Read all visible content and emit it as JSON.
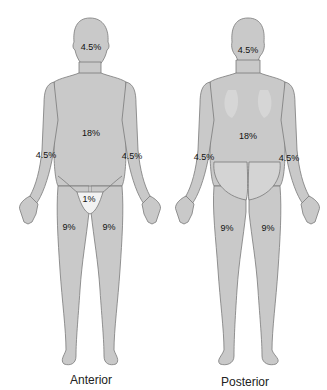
{
  "figure": {
    "colors": {
      "body_fill": "#c9c9c9",
      "body_outline": "#7a7a7a",
      "perineum_fill": "#f2f2f2",
      "label": "#111111"
    },
    "views": [
      {
        "id": "anterior",
        "caption": "Anterior",
        "labels": {
          "head": "4.5%",
          "trunk": "18%",
          "right_arm": "4.5%",
          "left_arm": "4.5%",
          "perineum": "1%",
          "right_leg": "9%",
          "left_leg": "9%"
        }
      },
      {
        "id": "posterior",
        "caption": "Posterior",
        "labels": {
          "head": "4.5%",
          "trunk": "18%",
          "right_arm": "4.5%",
          "left_arm": "4.5%",
          "right_leg": "9%",
          "left_leg": "9%"
        }
      }
    ]
  }
}
